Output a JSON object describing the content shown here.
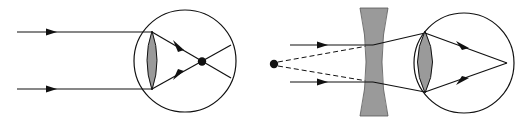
{
  "diagram": {
    "colors": {
      "stroke": "#111111",
      "lens_fill": "#9a9a9a",
      "background": "#ffffff"
    },
    "left_panel": {
      "name": "uncorrected-myopic-eye",
      "incoming_rays": 2,
      "focus_point": "in front of retina"
    },
    "right_panel": {
      "name": "corrected-eye-with-concave-lens",
      "incoming_rays": 2,
      "virtual_source": "dashed lines traced back to point",
      "focus_point": "on retina"
    }
  }
}
